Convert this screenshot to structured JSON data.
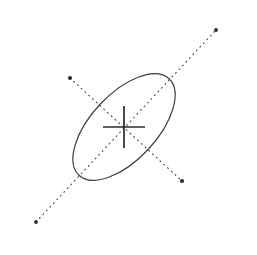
{
  "figure": {
    "background_color": "#ffffff",
    "width": 257,
    "height": 255
  },
  "chart_data": {
    "type": "scatter",
    "xlabel": "",
    "ylabel": "",
    "grid": false,
    "legend": "none",
    "xlim": [
      0,
      257
    ],
    "ylim": [
      255,
      0
    ],
    "ellipse": {
      "name": "ellipse-outline",
      "center_x": 124,
      "center_y": 127,
      "semi_major": 132,
      "semi_minor": 66,
      "rotation_deg": -47,
      "stroke_color": "#3b3b3b",
      "stroke_width": 1.15,
      "fill": "none"
    },
    "axes": [
      {
        "name": "major-axis",
        "style": "dotted",
        "x1": 36,
        "y1": 222,
        "x2": 216,
        "y2": 30,
        "length": 264,
        "stroke_color": "#4a4a4a"
      },
      {
        "name": "minor-axis",
        "style": "dotted",
        "x1": 70,
        "y1": 78,
        "x2": 182,
        "y2": 181,
        "length": 132,
        "stroke_color": "#4a4a4a"
      }
    ],
    "markers": [
      {
        "name": "centroid",
        "x": 124,
        "y": 127,
        "glyph": "cross"
      },
      {
        "name": "major-axis-endpoint-lower-left",
        "x": 36,
        "y": 222,
        "glyph": "dot"
      },
      {
        "name": "major-axis-endpoint-upper-right",
        "x": 216,
        "y": 30,
        "glyph": "dot"
      },
      {
        "name": "minor-axis-endpoint-upper-left",
        "x": 70,
        "y": 78,
        "glyph": "dot"
      },
      {
        "name": "minor-axis-endpoint-lower-right",
        "x": 182,
        "y": 181,
        "glyph": "dot"
      }
    ],
    "crosshair": {
      "center_x": 124,
      "center_y": 127,
      "arm_half_length_x": 21,
      "arm_half_length_y": 21,
      "stroke_color": "#2a2a2a",
      "stroke_width": 1.7
    },
    "colors": {
      "outline": "#3b3b3b",
      "axis": "#4a4a4a",
      "marker": "#2e2e2e",
      "background": "#ffffff"
    }
  }
}
